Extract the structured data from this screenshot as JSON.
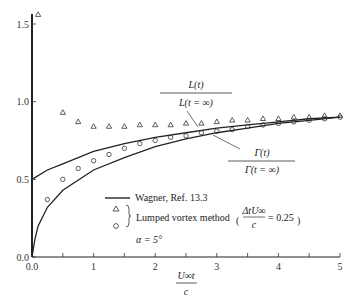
{
  "chart_data": {
    "type": "line",
    "title": "",
    "xlabel": "U∞t / c",
    "ylabel": "",
    "xlim": [
      0,
      5
    ],
    "ylim": [
      0,
      1.55
    ],
    "grid": false,
    "x_ticks": [
      "0.0",
      "1",
      "2",
      "3",
      "4",
      "5"
    ],
    "y_ticks": [
      "0.0",
      "0.5",
      "1.0",
      "1.5"
    ],
    "series": [
      {
        "name": "Wagner L(t)/L(t=∞)",
        "style": "line",
        "x": [
          0,
          0.25,
          0.5,
          1,
          1.5,
          2,
          2.5,
          3,
          3.5,
          4,
          4.5,
          5
        ],
        "y": [
          0.5,
          0.56,
          0.6,
          0.68,
          0.73,
          0.77,
          0.8,
          0.83,
          0.85,
          0.87,
          0.89,
          0.9
        ]
      },
      {
        "name": "Wagner Γ(t)/Γ(t=∞)",
        "style": "line",
        "x": [
          0,
          0.05,
          0.1,
          0.25,
          0.5,
          1,
          1.5,
          2,
          2.5,
          3,
          3.5,
          4,
          4.5,
          5
        ],
        "y": [
          0,
          0.12,
          0.2,
          0.32,
          0.43,
          0.56,
          0.64,
          0.71,
          0.76,
          0.8,
          0.83,
          0.86,
          0.88,
          0.9
        ]
      },
      {
        "name": "Lumped vortex method L(t)/L(t=∞)",
        "style": "triangle",
        "x": [
          0.1,
          0.5,
          0.75,
          1,
          1.25,
          1.5,
          1.75,
          2,
          2.25,
          2.5,
          2.75,
          3,
          3.25,
          3.5,
          3.75,
          4,
          4.25,
          4.5,
          4.75,
          5
        ],
        "y": [
          1.55,
          0.92,
          0.86,
          0.83,
          0.83,
          0.83,
          0.84,
          0.84,
          0.84,
          0.85,
          0.85,
          0.86,
          0.87,
          0.87,
          0.88,
          0.88,
          0.89,
          0.89,
          0.9,
          0.9
        ]
      },
      {
        "name": "Lumped vortex method Γ(t)/Γ(t=∞)",
        "style": "circle",
        "x": [
          0.25,
          0.5,
          0.75,
          1,
          1.25,
          1.5,
          1.75,
          2,
          2.25,
          2.5,
          2.75,
          3,
          3.25,
          3.5,
          3.75,
          4,
          4.25,
          4.5,
          4.75,
          5
        ],
        "y": [
          0.37,
          0.5,
          0.57,
          0.62,
          0.66,
          0.7,
          0.73,
          0.75,
          0.77,
          0.78,
          0.8,
          0.81,
          0.82,
          0.84,
          0.85,
          0.86,
          0.87,
          0.88,
          0.89,
          0.9
        ]
      }
    ],
    "annotations": [
      {
        "text_num": "L(t)",
        "text_den": "L(t = ∞)"
      },
      {
        "text_num": "Γ(t)",
        "text_den": "Γ(t = ∞)"
      }
    ],
    "legend": {
      "line_label": "Wagner, Ref. 13.3",
      "markers_label": "Lumped vortex method",
      "param_num": "ΔtU∞",
      "param_den": "c",
      "param_value": "= 0.25",
      "alpha": "α = 5°"
    }
  }
}
